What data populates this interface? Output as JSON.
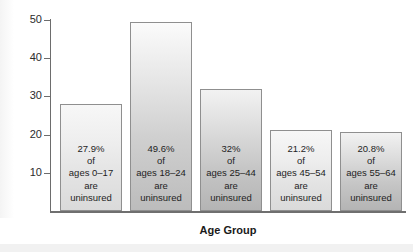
{
  "chart_data": {
    "type": "bar",
    "title": "",
    "xlabel": "Age Group",
    "ylabel": "",
    "ylim": [
      0,
      50
    ],
    "yticks": [
      10,
      20,
      30,
      40,
      50
    ],
    "ytick_labels": [
      "10",
      "20",
      "30",
      "40",
      "50"
    ],
    "grid": false,
    "legend": false,
    "categories": [
      "ages 0–17",
      "ages 18–24",
      "ages 25–44",
      "ages 45–54",
      "ages 55–64"
    ],
    "values": [
      27.9,
      49.6,
      32,
      21.2,
      20.8
    ],
    "bars": [
      {
        "category": "ages 0–17",
        "value": 27.9,
        "shade": "light",
        "lines": [
          "27.9%",
          "of",
          "ages 0–17",
          "are",
          "uninsured"
        ]
      },
      {
        "category": "ages 18–24",
        "value": 49.6,
        "shade": "mid",
        "lines": [
          "49.6%",
          "of",
          "ages 18–24",
          "are",
          "uninsured"
        ]
      },
      {
        "category": "ages 25–44",
        "value": 32,
        "shade": "dark",
        "lines": [
          "32%",
          "of",
          "ages 25–44",
          "are",
          "uninsured"
        ]
      },
      {
        "category": "ages 45–54",
        "value": 21.2,
        "shade": "light",
        "lines": [
          "21.2%",
          "of",
          "ages 45–54",
          "are",
          "uninsured"
        ]
      },
      {
        "category": "ages 55–64",
        "value": 20.8,
        "shade": "dark",
        "lines": [
          "20.8%",
          "of",
          "ages 55–64",
          "are",
          "uninsured"
        ]
      }
    ],
    "colors": {
      "axis": "#6d6d6d",
      "bar_border": "#8f8f8f",
      "bar_fill_light": "#dadada",
      "bar_fill_mid": "#bcbcbc",
      "bar_fill_dark": "#b4b4b4",
      "text": "#1e1e1e",
      "background": "#ffffff"
    }
  }
}
